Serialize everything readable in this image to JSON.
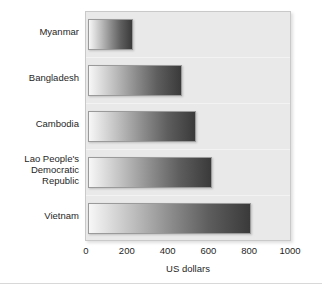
{
  "chart_data": {
    "type": "bar",
    "orientation": "horizontal",
    "title": "",
    "xlabel": "US dollars",
    "ylabel": "",
    "xlim": [
      0,
      1000
    ],
    "xticks": [
      0,
      200,
      400,
      600,
      800,
      1000
    ],
    "xtick_labels": [
      "0",
      "200",
      "400",
      "600",
      "800",
      "1000"
    ],
    "grid": false,
    "legend": null,
    "categories": [
      "Myanmar",
      "Bangladesh",
      "Cambodia",
      "Lao People's\nDemocratic\nRepublic",
      "Vietnam"
    ],
    "category_labels_flat": [
      "Myanmar",
      "Bangladesh",
      "Cambodia",
      "Lao People's Democratic Republic",
      "Vietnam"
    ],
    "values": [
      220,
      460,
      530,
      610,
      800
    ],
    "series": [
      {
        "name": "US dollars",
        "values": [
          220,
          460,
          530,
          610,
          800
        ]
      }
    ],
    "bar_fill": "linear-gradient light-to-dark grey",
    "colors": {
      "bar_gradient_start": "#f7f7f7",
      "bar_gradient_end": "#3a3a3a",
      "bar_border": "#9a9a9a",
      "plot_background": "#e9e9e9",
      "plot_border": "#c9c9c9",
      "page_background": "#ffffff",
      "text": "#1f1f1f"
    }
  }
}
